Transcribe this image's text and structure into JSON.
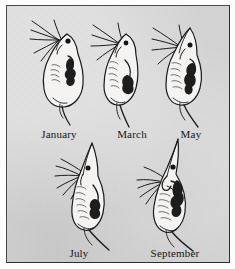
{
  "figure": {
    "plate_background_color": "#d2d2d2",
    "frame_color": "#3a3a3a",
    "ink_color": "#1a1a1a",
    "body_fill_color": "#f2f2f0",
    "gut_color": "#1c1c1c",
    "rows": 2,
    "specimen_count": 5
  },
  "specimens": [
    {
      "id": "january",
      "label": "January",
      "row": 1,
      "position": 1,
      "helmet": "rounded, no crest",
      "relative_helmet_height": 0.05,
      "tail_spine": "short",
      "antennae_direction": "upper-left"
    },
    {
      "id": "march",
      "label": "March",
      "row": 1,
      "position": 2,
      "helmet": "slightly raised",
      "relative_helmet_height": 0.2,
      "tail_spine": "short",
      "antennae_direction": "upper-left"
    },
    {
      "id": "may",
      "label": "May",
      "row": 1,
      "position": 3,
      "helmet": "pointed crest forming",
      "relative_helmet_height": 0.45,
      "tail_spine": "medium",
      "antennae_direction": "upper-left"
    },
    {
      "id": "july",
      "label": "July",
      "row": 2,
      "position": 1,
      "helmet": "tall pointed crest",
      "relative_helmet_height": 0.8,
      "tail_spine": "long",
      "antennae_direction": "left"
    },
    {
      "id": "september",
      "label": "September",
      "row": 2,
      "position": 2,
      "helmet": "tallest, curved crest",
      "relative_helmet_height": 1.0,
      "tail_spine": "long",
      "antennae_direction": "lower-left"
    }
  ]
}
